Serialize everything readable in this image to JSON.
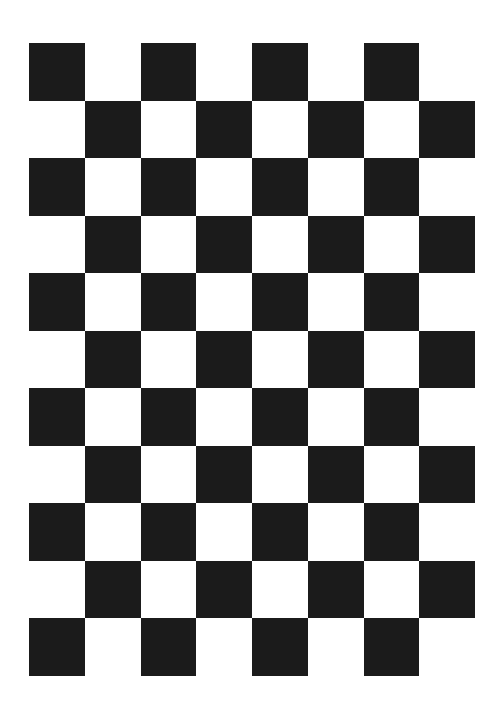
{
  "board": {
    "title": "Checkerboard calibration pattern",
    "columns": 8,
    "rows": 11,
    "dark_color": "#1b1b1b",
    "light_color": "#ffffff",
    "top_left_is_dark": true
  }
}
